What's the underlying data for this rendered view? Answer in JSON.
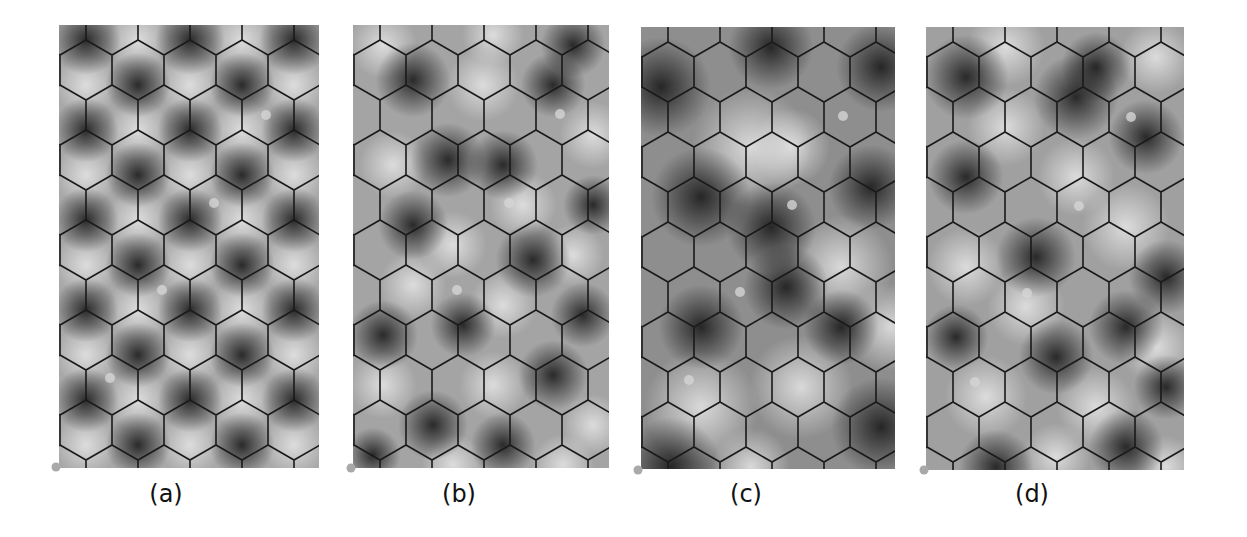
{
  "figure": {
    "background": "#ffffff",
    "hex_grid": {
      "orientation": "pointy-top",
      "hex_width": 52,
      "side": 30,
      "row_pitch": 45,
      "first_offset_x": 27,
      "line_color": "#1a1a1a",
      "line_width": 1.6
    },
    "panels": [
      {
        "id": "a",
        "caption": "(a)",
        "x": 59,
        "y": 25,
        "w": 260,
        "h": 443,
        "caption_x": 148,
        "caption_y": 480,
        "base": "#a8a8a8",
        "corner_marker": [
          -3,
          442
        ],
        "markers": [
          [
            207,
            90
          ],
          [
            155,
            178
          ],
          [
            103,
            265
          ],
          [
            51,
            353
          ]
        ],
        "blobs": {
          "dark": [
            [
              27,
              15,
              28
            ],
            [
              131,
              15,
              28
            ],
            [
              235,
              15,
              28
            ],
            [
              79,
              60,
              26
            ],
            [
              183,
              60,
              26
            ],
            [
              27,
              105,
              26
            ],
            [
              131,
              105,
              26
            ],
            [
              235,
              105,
              26
            ],
            [
              79,
              150,
              26
            ],
            [
              183,
              150,
              26
            ],
            [
              27,
              195,
              26
            ],
            [
              131,
              195,
              26
            ],
            [
              235,
              195,
              26
            ],
            [
              79,
              240,
              26
            ],
            [
              183,
              240,
              26
            ],
            [
              27,
              285,
              26
            ],
            [
              131,
              285,
              26
            ],
            [
              235,
              285,
              26
            ],
            [
              79,
              330,
              26
            ],
            [
              183,
              330,
              26
            ],
            [
              27,
              375,
              26
            ],
            [
              131,
              375,
              26
            ],
            [
              235,
              375,
              26
            ],
            [
              79,
              420,
              26
            ],
            [
              183,
              420,
              26
            ]
          ],
          "light": [
            [
              79,
              15,
              24
            ],
            [
              183,
              15,
              24
            ],
            [
              27,
              60,
              24
            ],
            [
              131,
              60,
              24
            ],
            [
              235,
              60,
              24
            ],
            [
              79,
              105,
              24
            ],
            [
              183,
              105,
              24
            ],
            [
              27,
              150,
              24
            ],
            [
              131,
              150,
              24
            ],
            [
              235,
              150,
              24
            ],
            [
              79,
              195,
              24
            ],
            [
              183,
              195,
              24
            ],
            [
              27,
              240,
              24
            ],
            [
              131,
              240,
              24
            ],
            [
              235,
              240,
              24
            ],
            [
              79,
              285,
              24
            ],
            [
              183,
              285,
              24
            ],
            [
              27,
              330,
              24
            ],
            [
              131,
              330,
              24
            ],
            [
              235,
              330,
              24
            ],
            [
              79,
              375,
              24
            ],
            [
              183,
              375,
              24
            ],
            [
              27,
              420,
              24
            ],
            [
              131,
              420,
              24
            ],
            [
              235,
              420,
              24
            ]
          ]
        }
      },
      {
        "id": "b",
        "caption": "(b)",
        "x": 353,
        "y": 25,
        "w": 256,
        "h": 443,
        "caption_x": 441,
        "caption_y": 480,
        "base": "#a4a4a4",
        "corner_marker": [
          -2,
          443
        ],
        "markers": [
          [
            207,
            89
          ],
          [
            156,
            178
          ],
          [
            104,
            265
          ]
        ],
        "blobs": {
          "dark": [
            [
              60,
              55,
              30
            ],
            [
              220,
              20,
              26
            ],
            [
              95,
              135,
              30
            ],
            [
              200,
              60,
              26
            ],
            [
              60,
              200,
              28
            ],
            [
              150,
              140,
              28
            ],
            [
              240,
              180,
              24
            ],
            [
              30,
              310,
              28
            ],
            [
              180,
              235,
              30
            ],
            [
              110,
              300,
              26
            ],
            [
              230,
              290,
              26
            ],
            [
              80,
              400,
              28
            ],
            [
              200,
              350,
              28
            ],
            [
              150,
              420,
              26
            ],
            [
              20,
              430,
              22
            ]
          ],
          "light": [
            [
              30,
              20,
              26
            ],
            [
              140,
              10,
              24
            ],
            [
              130,
              60,
              28
            ],
            [
              240,
              110,
              26
            ],
            [
              40,
              140,
              26
            ],
            [
              170,
              180,
              26
            ],
            [
              100,
              220,
              26
            ],
            [
              220,
              230,
              24
            ],
            [
              60,
              260,
              26
            ],
            [
              150,
              280,
              26
            ],
            [
              30,
              360,
              26
            ],
            [
              140,
              360,
              26
            ],
            [
              240,
              400,
              24
            ],
            [
              100,
              440,
              24
            ],
            [
              210,
              440,
              24
            ]
          ]
        }
      },
      {
        "id": "c",
        "caption": "(c)",
        "x": 641,
        "y": 27,
        "w": 254,
        "h": 442,
        "caption_x": 728,
        "caption_y": 480,
        "base": "#8e8e8e",
        "corner_marker": [
          -3,
          443
        ],
        "markers": [
          [
            202,
            89
          ],
          [
            151,
            178
          ],
          [
            99,
            265
          ],
          [
            48,
            353
          ]
        ],
        "blobs": {
          "dark": [
            [
              20,
              60,
              40
            ],
            [
              240,
              40,
              36
            ],
            [
              130,
              20,
              34
            ],
            [
              60,
              170,
              40
            ],
            [
              230,
              160,
              34
            ],
            [
              130,
              200,
              36
            ],
            [
              145,
              260,
              34
            ],
            [
              30,
              440,
              40
            ],
            [
              240,
              400,
              40
            ],
            [
              200,
              300,
              30
            ],
            [
              60,
              300,
              34
            ]
          ],
          "light": [
            [
              110,
              120,
              46
            ],
            [
              200,
              240,
              40
            ],
            [
              60,
              380,
              44
            ],
            [
              160,
              360,
              40
            ],
            [
              150,
              120,
              30
            ],
            [
              250,
              300,
              34
            ],
            [
              110,
              440,
              30
            ]
          ]
        }
      },
      {
        "id": "d",
        "caption": "(d)",
        "x": 926,
        "y": 27,
        "w": 258,
        "h": 443,
        "caption_x": 1014,
        "caption_y": 480,
        "base": "#a0a0a0",
        "corner_marker": [
          -2,
          443
        ],
        "markers": [
          [
            205,
            90
          ],
          [
            153,
            179
          ],
          [
            101,
            266
          ],
          [
            49,
            355
          ]
        ],
        "blobs": {
          "dark": [
            [
              40,
              50,
              34
            ],
            [
              150,
              70,
              34
            ],
            [
              220,
              110,
              30
            ],
            [
              40,
              150,
              30
            ],
            [
              110,
              230,
              32
            ],
            [
              170,
              40,
              28
            ],
            [
              240,
              250,
              30
            ],
            [
              130,
              330,
              30
            ],
            [
              200,
              300,
              30
            ],
            [
              30,
              310,
              26
            ],
            [
              70,
              440,
              30
            ],
            [
              200,
              420,
              30
            ],
            [
              240,
              360,
              26
            ]
          ],
          "light": [
            [
              80,
              20,
              30
            ],
            [
              230,
              30,
              28
            ],
            [
              80,
              100,
              30
            ],
            [
              200,
              200,
              34
            ],
            [
              150,
              150,
              30
            ],
            [
              40,
              240,
              30
            ],
            [
              230,
              320,
              28
            ],
            [
              100,
              280,
              30
            ],
            [
              60,
              370,
              32
            ],
            [
              170,
              380,
              30
            ],
            [
              130,
              430,
              26
            ],
            [
              240,
              440,
              24
            ]
          ]
        }
      }
    ]
  }
}
